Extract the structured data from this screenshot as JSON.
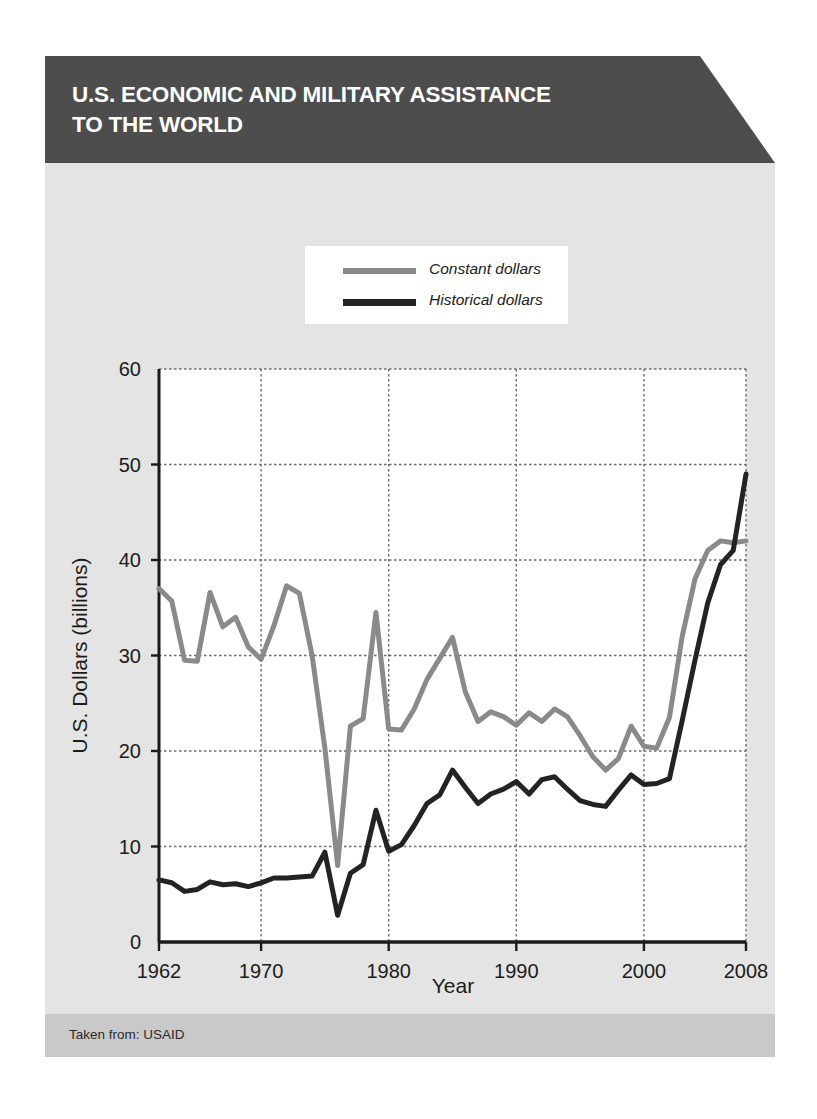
{
  "header": {
    "title": "U.S. ECONOMIC AND MILITARY ASSISTANCE\nTO THE WORLD"
  },
  "footer": {
    "source": "Taken from: USAID"
  },
  "colors": {
    "header_bg": "#4d4d4d",
    "body_bg": "#e4e4e4",
    "footer_bg": "#c9c9c9",
    "plot_bg": "#ffffff",
    "constant_dollars": "#8a8a8a",
    "historical_dollars": "#232323",
    "axis": "#1b1b1b",
    "gridline": "#6e6e6e"
  },
  "legend": {
    "position": "top-center",
    "entries": [
      {
        "label": "Constant dollars",
        "color": "#8a8a8a"
      },
      {
        "label": "Historical dollars",
        "color": "#232323"
      }
    ]
  },
  "chart_data": {
    "type": "line",
    "title": "U.S. ECONOMIC AND MILITARY ASSISTANCE TO THE WORLD",
    "xlabel": "Year",
    "ylabel": "U.S. Dollars (billions)",
    "xlim": [
      1962,
      2008
    ],
    "ylim": [
      0,
      60
    ],
    "xticks": [
      1962,
      1970,
      1980,
      1990,
      2000,
      2008
    ],
    "xtick_labels": [
      "1962",
      "1970",
      "1980",
      "1990",
      "2000",
      "2008"
    ],
    "yticks": [
      0,
      10,
      20,
      30,
      40,
      50,
      60
    ],
    "ytick_labels": [
      "0",
      "10",
      "20",
      "30",
      "40",
      "50",
      "60"
    ],
    "grid": true,
    "grid_style": "dotted",
    "legend_position": "top-center",
    "x": [
      1962,
      1963,
      1964,
      1965,
      1966,
      1967,
      1968,
      1969,
      1970,
      1971,
      1972,
      1973,
      1974,
      1975,
      1976,
      1977,
      1978,
      1979,
      1980,
      1981,
      1982,
      1983,
      1984,
      1985,
      1986,
      1987,
      1988,
      1989,
      1990,
      1991,
      1992,
      1993,
      1994,
      1995,
      1996,
      1997,
      1998,
      1999,
      2000,
      2001,
      2002,
      2003,
      2004,
      2005,
      2006,
      2007,
      2008
    ],
    "series": [
      {
        "name": "Constant dollars",
        "color": "#8a8a8a",
        "values": [
          37.0,
          35.7,
          29.5,
          29.4,
          36.6,
          33.0,
          34.0,
          30.9,
          29.6,
          33.1,
          37.3,
          36.5,
          30.0,
          20.3,
          8.0,
          22.6,
          23.4,
          34.5,
          22.3,
          22.2,
          24.4,
          27.5,
          29.7,
          31.9,
          26.2,
          23.1,
          24.1,
          23.6,
          22.7,
          24.0,
          23.1,
          24.4,
          23.6,
          21.6,
          19.4,
          18.0,
          19.2,
          22.6,
          20.5,
          20.3,
          23.5,
          32.0,
          38.0,
          41.0,
          42.0,
          41.8,
          42.0
        ]
      },
      {
        "name": "Historical dollars",
        "color": "#232323",
        "values": [
          6.5,
          6.2,
          5.3,
          5.5,
          6.3,
          6.0,
          6.1,
          5.8,
          6.2,
          6.7,
          6.7,
          6.8,
          6.9,
          9.4,
          2.8,
          7.2,
          8.1,
          13.8,
          9.5,
          10.2,
          12.2,
          14.5,
          15.4,
          18.0,
          16.2,
          14.5,
          15.5,
          16.0,
          16.8,
          15.5,
          17.0,
          17.3,
          16.0,
          14.8,
          14.4,
          14.2,
          15.9,
          17.5,
          16.5,
          16.6,
          17.1,
          23.2,
          29.5,
          35.5,
          39.5,
          41.0,
          49.0
        ]
      }
    ]
  }
}
